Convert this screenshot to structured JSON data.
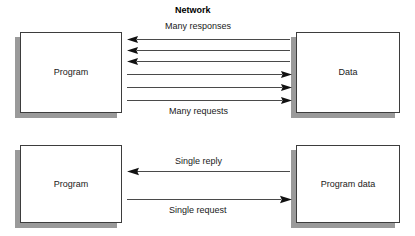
{
  "diagram": {
    "title": "Network",
    "background_color": "#ffffff",
    "line_color": "#4a4a4a",
    "box_border_color": "#3d3d3d",
    "box_fill_color": "#ffffff",
    "shadow_color": "#9a9a9a",
    "text_color": "#1a1a1a",
    "groups": [
      {
        "id": "chatty-network",
        "nodes": [
          {
            "id": "program-top",
            "label": "Program"
          },
          {
            "id": "data-top",
            "label": "Data"
          }
        ],
        "captions": [
          {
            "id": "many-responses",
            "label": "Many responses",
            "direction": "left",
            "count": 3
          },
          {
            "id": "many-requests",
            "label": "Many requests",
            "direction": "right",
            "count": 3
          }
        ]
      },
      {
        "id": "coarse-network",
        "nodes": [
          {
            "id": "program-bottom",
            "label": "Program"
          },
          {
            "id": "program-data-bottom",
            "label": "Program data"
          }
        ],
        "captions": [
          {
            "id": "single-reply",
            "label": "Single reply",
            "direction": "left",
            "count": 1
          },
          {
            "id": "single-request",
            "label": "Single request",
            "direction": "right",
            "count": 1
          }
        ]
      }
    ]
  }
}
